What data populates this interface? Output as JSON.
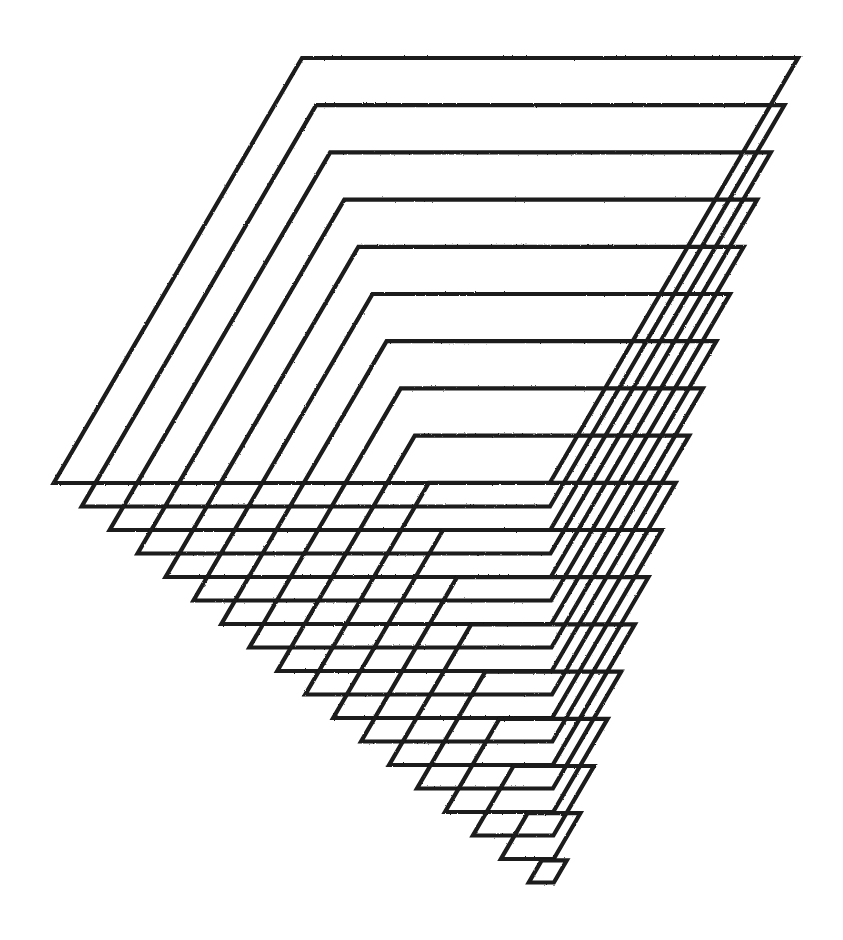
{
  "artwork": {
    "description": "Plotter drawing of nested, progressively shrinking parallelograms forming a lattice",
    "background_color": "#ffffff",
    "stroke_color": "#1a1a1a",
    "stroke_width": 4.2,
    "shape_count": 18,
    "edge_slope_dx_per_dy": -0.584,
    "first_shape": {
      "top_left": [
        302,
        58
      ],
      "top_right": [
        798,
        58
      ],
      "bottom_y": 483
    },
    "per_shape_step": {
      "top_left_dx": 14.1,
      "top_right_dx": -13.6,
      "top_dy": 47.2,
      "bottom_dy": 23.5
    }
  }
}
